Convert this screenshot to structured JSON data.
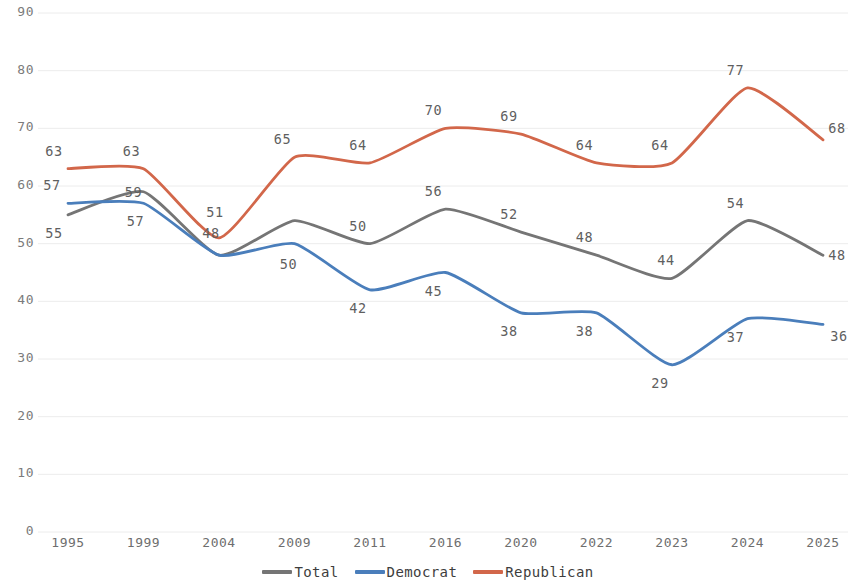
{
  "chart_data": {
    "type": "line",
    "title": "",
    "subtitle": "",
    "xlabel": "",
    "ylabel": "",
    "x": [
      "1995",
      "1999",
      "2004",
      "2009",
      "2011",
      "2016",
      "2020",
      "2022",
      "2023",
      "2024",
      "2025"
    ],
    "xlim": [
      0,
      10
    ],
    "ylim": [
      0,
      90
    ],
    "yticks": [
      0,
      10,
      20,
      30,
      40,
      50,
      60,
      70,
      80,
      90
    ],
    "ytick_labels": [
      "0",
      "10",
      "20",
      "30",
      "40",
      "50",
      "60",
      "70",
      "80",
      "90"
    ],
    "grid": "horizontal",
    "legend_position": "bottom-center",
    "series": [
      {
        "name": "Total",
        "color": "#757575",
        "values": [
          55,
          59,
          48,
          54,
          50,
          56,
          52,
          48,
          44,
          54,
          48
        ],
        "labels": [
          "55",
          "59",
          "48",
          "54",
          "50",
          "56",
          "52",
          "48",
          "44",
          "54",
          "48"
        ],
        "shown_labels": [
          {
            "index": 0,
            "text": "55"
          },
          {
            "index": 1,
            "text": "59"
          },
          {
            "index": 2,
            "text": "48"
          },
          {
            "index": 4,
            "text": "50"
          },
          {
            "index": 5,
            "text": "56"
          },
          {
            "index": 6,
            "text": "52"
          },
          {
            "index": 7,
            "text": "48"
          },
          {
            "index": 8,
            "text": "44"
          },
          {
            "index": 9,
            "text": "54"
          },
          {
            "index": 10,
            "text": "48"
          }
        ]
      },
      {
        "name": "Democrat",
        "color": "#4a7ebb",
        "values": [
          57,
          57,
          48,
          50,
          42,
          45,
          38,
          38,
          29,
          37,
          36
        ],
        "labels": [
          "57",
          "57",
          "48",
          "50",
          "42",
          "45",
          "38",
          "38",
          "29",
          "37",
          "36"
        ],
        "shown_labels": [
          {
            "index": 0,
            "text": "57"
          },
          {
            "index": 1,
            "text": "57"
          },
          {
            "index": 3,
            "text": "50"
          },
          {
            "index": 4,
            "text": "42"
          },
          {
            "index": 5,
            "text": "45"
          },
          {
            "index": 6,
            "text": "38"
          },
          {
            "index": 7,
            "text": "38"
          },
          {
            "index": 8,
            "text": "29"
          },
          {
            "index": 9,
            "text": "37"
          },
          {
            "index": 10,
            "text": "36"
          }
        ]
      },
      {
        "name": "Republican",
        "color": "#d2674a",
        "values": [
          63,
          63,
          51,
          65,
          64,
          70,
          69,
          64,
          64,
          77,
          68
        ],
        "labels": [
          "63",
          "63",
          "51",
          "65",
          "64",
          "70",
          "69",
          "64",
          "64",
          "77",
          "68"
        ],
        "shown_labels": [
          {
            "index": 0,
            "text": "63"
          },
          {
            "index": 1,
            "text": "63"
          },
          {
            "index": 2,
            "text": "51"
          },
          {
            "index": 3,
            "text": "65"
          },
          {
            "index": 4,
            "text": "64"
          },
          {
            "index": 5,
            "text": "70"
          },
          {
            "index": 6,
            "text": "69"
          },
          {
            "index": 7,
            "text": "64"
          },
          {
            "index": 8,
            "text": "64"
          },
          {
            "index": 9,
            "text": "77"
          },
          {
            "index": 10,
            "text": "68"
          }
        ]
      }
    ],
    "extra_labels": [
      {
        "text": "59",
        "series": "Total",
        "note": "label for 1999 Total placed below Republican 1999 label"
      }
    ]
  },
  "legend": {
    "items": [
      {
        "label": "Total",
        "color": "#757575"
      },
      {
        "label": "Democrat",
        "color": "#4a7ebb"
      },
      {
        "label": "Republican",
        "color": "#d2674a"
      }
    ]
  },
  "colors": {
    "total": "#757575",
    "democrat": "#4a7ebb",
    "republican": "#d2674a",
    "grid": "#ececec",
    "tick_text": "#7b7b7b",
    "label_text": "#5f5f5f",
    "background": "#ffffff"
  }
}
